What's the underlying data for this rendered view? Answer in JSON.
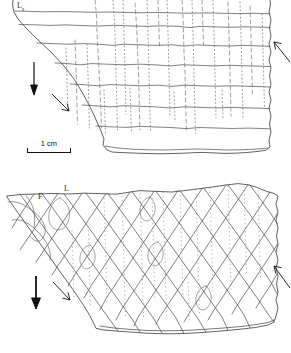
{
  "figure": {
    "kind": "line-drawing",
    "background_color": "#ffffff",
    "ink_color": "#4a4a4a",
    "outline_color": "#3c3c3c",
    "panel_count": 2
  },
  "scale_bar": {
    "label": "1 cm",
    "length_px": 44
  },
  "panel_top": {
    "name": "upper-specimen-sketch",
    "labels": [
      {
        "id": "Ls",
        "base": "L",
        "sub": "s",
        "left": 17,
        "top": 1
      }
    ],
    "annotations": {
      "down_arrow": "solid-down-arrow",
      "shear_arrow": "open-diagonal-arrow",
      "right_arrow": "open-up-right-arrow"
    },
    "fabric": {
      "type": "sub-horizontal-layering",
      "solid_bands": 7,
      "dashed_cross_lines": 22
    }
  },
  "panel_bottom": {
    "name": "lower-specimen-sketch",
    "labels": [
      {
        "id": "F",
        "base": "F",
        "sub": "",
        "left": 38,
        "top": 192
      },
      {
        "id": "L",
        "base": "L",
        "sub": "",
        "left": 64,
        "top": 184
      }
    ],
    "annotations": {
      "down_arrow": "solid-down-arrow",
      "shear_arrow": "open-diagonal-arrow",
      "right_arrow": "open-up-right-arrow"
    },
    "fabric": {
      "type": "rhombic-shear-network",
      "dextral_lines": 11,
      "sinistral_lines": 11,
      "dotted_vertical_lines": 14
    }
  }
}
